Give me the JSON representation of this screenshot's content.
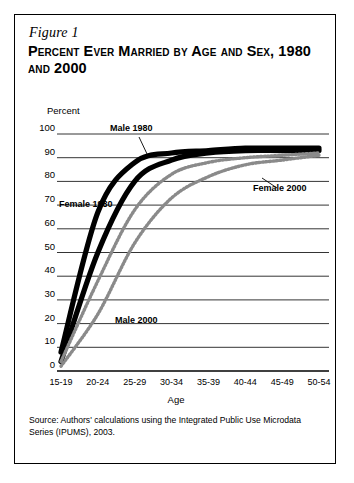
{
  "figure": {
    "label": "Figure 1",
    "title": "Percent Ever Married by Age and Sex, 1980 and 2000",
    "source": "Source: Authors' calculations using the Integrated Public Use Microdata Series (IPUMS), 2003."
  },
  "annotations": {
    "male_1980": "Male 1980",
    "female_1980": "Female 1980",
    "female_2000": "Female 2000",
    "male_2000": "Male 2000"
  },
  "colors": {
    "line_1980": "#000000",
    "line_2000_female": "#8a8a8a",
    "line_2000_male": "#8a8a8a",
    "gridline": "#000000",
    "border": "#000000",
    "background": "#ffffff"
  },
  "chart_data": {
    "type": "line",
    "title": "Percent Ever Married by Age and Sex, 1980 and 2000",
    "xlabel": "Age",
    "ylabel": "Percent",
    "categories": [
      "15-19",
      "20-24",
      "25-29",
      "30-34",
      "35-39",
      "40-44",
      "45-49",
      "50-54"
    ],
    "ylim": [
      0,
      100
    ],
    "yticks": [
      0,
      10,
      20,
      30,
      40,
      50,
      60,
      70,
      80,
      90,
      100
    ],
    "grid": true,
    "legend": "inline-annotations",
    "series": [
      {
        "name": "Female 1980",
        "values": [
          8,
          67,
          88,
          92,
          93,
          94,
          94,
          94
        ]
      },
      {
        "name": "Male 1980",
        "values": [
          4,
          50,
          80,
          89,
          92,
          93,
          93,
          93
        ]
      },
      {
        "name": "Female 2000",
        "values": [
          4,
          38,
          68,
          83,
          88,
          90,
          91,
          92
        ]
      },
      {
        "name": "Male 2000",
        "values": [
          2,
          24,
          54,
          73,
          82,
          87,
          89,
          91
        ]
      }
    ]
  }
}
